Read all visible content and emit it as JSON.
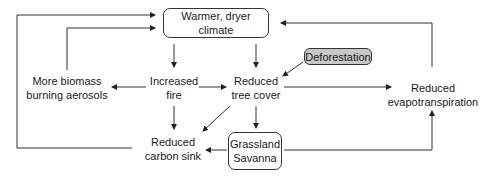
{
  "diagram": {
    "title": "",
    "nodes": {
      "warmer": {
        "label": "Warmer, dryer climate"
      },
      "deforestation": {
        "label": "Deforestation",
        "fill": "#c8c8c8"
      },
      "biomass": {
        "line1": "More biomass",
        "line2": "burning aerosols"
      },
      "fire": {
        "line1": "Increased",
        "line2": "fire"
      },
      "tree": {
        "line1": "Reduced",
        "line2": "tree cover"
      },
      "evap": {
        "line1": "Reduced",
        "line2": "evapotranspiration"
      },
      "carbon": {
        "line1": "Reduced",
        "line2": "carbon sink"
      },
      "grass": {
        "line1": "Grassland",
        "line2": "Savanna"
      }
    },
    "edges": [
      {
        "from": "Warmer, dryer climate",
        "to": "Increased fire"
      },
      {
        "from": "Warmer, dryer climate",
        "to": "Reduced tree cover"
      },
      {
        "from": "Deforestation",
        "to": "Reduced tree cover"
      },
      {
        "from": "Increased fire",
        "to": "More biomass burning aerosols"
      },
      {
        "from": "Increased fire",
        "to": "Reduced tree cover"
      },
      {
        "from": "Increased fire",
        "to": "Reduced carbon sink"
      },
      {
        "from": "More biomass burning aerosols",
        "to": "Warmer, dryer climate"
      },
      {
        "from": "Reduced tree cover",
        "to": "Reduced evapotranspiration"
      },
      {
        "from": "Reduced tree cover",
        "to": "Reduced carbon sink"
      },
      {
        "from": "Reduced tree cover",
        "to": "Grassland Savanna"
      },
      {
        "from": "Grassland Savanna",
        "to": "Reduced carbon sink"
      },
      {
        "from": "Grassland Savanna",
        "to": "Reduced evapotranspiration"
      },
      {
        "from": "Reduced evapotranspiration",
        "to": "Warmer, dryer climate"
      },
      {
        "from": "Reduced carbon sink",
        "to": "Warmer, dryer climate"
      }
    ]
  }
}
